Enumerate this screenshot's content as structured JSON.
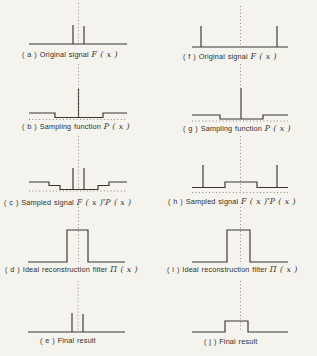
{
  "figure": {
    "background": "#f5f3ee",
    "line_color": "#39362f",
    "dotted_color": "#8f8b82",
    "text_color": "#33302a",
    "panels": [
      {
        "id": "a",
        "caption": {
          "prefix": "( a ) Original signal",
          "math1": "F ( x )"
        },
        "label_pos": {
          "x": 22,
          "y": 49.5
        },
        "shapes": [
          {
            "kind": "solid",
            "pts": [
              [
                29,
                44
              ],
              [
                127,
                44
              ]
            ]
          },
          {
            "kind": "solid",
            "pts": [
              [
                73,
                44
              ],
              [
                73,
                25
              ]
            ]
          },
          {
            "kind": "solid",
            "pts": [
              [
                84,
                44
              ],
              [
                84,
                26
              ]
            ]
          },
          {
            "kind": "dotted",
            "pts": [
              [
                78.5,
                3
              ],
              [
                78.5,
                44
              ]
            ]
          }
        ]
      },
      {
        "id": "b",
        "caption": {
          "prefix": "( b ) Sampling function",
          "math1": "P ( x )"
        },
        "label_pos": {
          "x": 22,
          "y": 121.5
        },
        "shapes": [
          {
            "kind": "solid",
            "pts": [
              [
                29,
                113
              ],
              [
                55,
                113
              ],
              [
                55,
                117.5
              ],
              [
                103,
                117.5
              ],
              [
                103,
                113
              ],
              [
                127,
                113
              ]
            ]
          },
          {
            "kind": "solid",
            "pts": [
              [
                78.5,
                117.5
              ],
              [
                78.5,
                89
              ]
            ]
          },
          {
            "kind": "dotted",
            "pts": [
              [
                29,
                119.5
              ],
              [
                127,
                119.5
              ]
            ]
          },
          {
            "kind": "dotted",
            "pts": [
              [
                78.5,
                64
              ],
              [
                78.5,
                117
              ]
            ]
          }
        ]
      },
      {
        "id": "c",
        "caption": {
          "prefix": "( c ) Sampled signal",
          "math1": "F ( x )",
          "star": "*",
          "math2": "P ( x )"
        },
        "label_pos": {
          "x": 4,
          "y": 195.5
        },
        "shapes": [
          {
            "kind": "solid",
            "pts": [
              [
                29,
                182
              ],
              [
                49,
                182
              ],
              [
                49,
                185.5
              ],
              [
                60,
                185.5
              ],
              [
                60,
                189.5
              ],
              [
                98,
                189.5
              ],
              [
                98,
                185.5
              ],
              [
                109,
                185.5
              ],
              [
                109,
                182
              ],
              [
                127,
                182
              ]
            ]
          },
          {
            "kind": "solid",
            "pts": [
              [
                73,
                189.5
              ],
              [
                73,
                168
              ]
            ]
          },
          {
            "kind": "solid",
            "pts": [
              [
                84,
                189.5
              ],
              [
                84,
                168
              ]
            ]
          },
          {
            "kind": "dotted",
            "pts": [
              [
                29,
                191
              ],
              [
                127,
                191
              ]
            ]
          },
          {
            "kind": "dotted",
            "pts": [
              [
                78.5,
                136
              ],
              [
                78.5,
                190
              ]
            ]
          }
        ]
      },
      {
        "id": "d",
        "caption": {
          "prefix": "( d ) Ideal reconstruction filter",
          "math1": "Π ( x )"
        },
        "label_pos": {
          "x": 5,
          "y": 264.5
        },
        "shapes": [
          {
            "kind": "solid",
            "pts": [
              [
                28,
                262
              ],
              [
                67,
                262
              ],
              [
                67,
                230
              ],
              [
                88,
                230
              ],
              [
                88,
                262
              ],
              [
                125,
                262
              ]
            ]
          },
          {
            "kind": "dotted",
            "pts": [
              [
                78.5,
                207
              ],
              [
                78.5,
                262
              ]
            ]
          }
        ]
      },
      {
        "id": "e",
        "caption": {
          "prefix": "( e ) Final result"
        },
        "label_pos": {
          "x": 40,
          "y": 336
        },
        "shapes": [
          {
            "kind": "solid",
            "pts": [
              [
                28,
                332
              ],
              [
                125,
                332
              ]
            ]
          },
          {
            "kind": "solid",
            "pts": [
              [
                72,
                332
              ],
              [
                72,
                313
              ]
            ]
          },
          {
            "kind": "solid",
            "pts": [
              [
                83,
                332
              ],
              [
                83,
                314
              ]
            ]
          },
          {
            "kind": "dotted",
            "pts": [
              [
                78,
                281
              ],
              [
                78,
                332
              ]
            ]
          }
        ]
      },
      {
        "id": "f",
        "caption": {
          "prefix": "( f ) Original signal",
          "math1": "F ( x )"
        },
        "label_pos": {
          "x": 183,
          "y": 52
        },
        "shapes": [
          {
            "kind": "solid",
            "pts": [
              [
                192,
                47
              ],
              [
                288,
                47
              ]
            ]
          },
          {
            "kind": "solid",
            "pts": [
              [
                201,
                47
              ],
              [
                201,
                26
              ]
            ]
          },
          {
            "kind": "solid",
            "pts": [
              [
                277,
                47
              ],
              [
                277,
                26
              ]
            ]
          },
          {
            "kind": "dotted",
            "pts": [
              [
                240.5,
                6
              ],
              [
                240.5,
                47
              ]
            ]
          }
        ]
      },
      {
        "id": "g",
        "caption": {
          "prefix": "( g ) Sampling function",
          "math1": "P ( x )"
        },
        "label_pos": {
          "x": 183,
          "y": 123.5
        },
        "shapes": [
          {
            "kind": "solid",
            "pts": [
              [
                192,
                115
              ],
              [
                220,
                115
              ],
              [
                220,
                119
              ],
              [
                263,
                119
              ],
              [
                263,
                115
              ],
              [
                288,
                115
              ]
            ]
          },
          {
            "kind": "solid",
            "pts": [
              [
                241,
                119
              ],
              [
                241,
                88
              ]
            ]
          },
          {
            "kind": "dotted",
            "pts": [
              [
                192,
                121
              ],
              [
                288,
                121
              ]
            ]
          },
          {
            "kind": "dotted",
            "pts": [
              [
                240.5,
                64
              ],
              [
                240.5,
                119
              ]
            ]
          }
        ]
      },
      {
        "id": "h",
        "caption": {
          "prefix": "( h ) Sampled signal",
          "math1": "F ( x )",
          "star": "*",
          "math2": "P ( x )"
        },
        "label_pos": {
          "x": 168,
          "y": 195
        },
        "shapes": [
          {
            "kind": "solid",
            "pts": [
              [
                192,
                187.5
              ],
              [
                225,
                187.5
              ],
              [
                225,
                182
              ],
              [
                257,
                182
              ],
              [
                257,
                187.5
              ],
              [
                288,
                187.5
              ]
            ]
          },
          {
            "kind": "solid",
            "pts": [
              [
                203,
                187.5
              ],
              [
                203,
                165
              ]
            ]
          },
          {
            "kind": "solid",
            "pts": [
              [
                277,
                187.5
              ],
              [
                277,
                165
              ]
            ]
          },
          {
            "kind": "dotted",
            "pts": [
              [
                192,
                192.5
              ],
              [
                288,
                192.5
              ]
            ]
          },
          {
            "kind": "dotted",
            "pts": [
              [
                240.5,
                136
              ],
              [
                240.5,
                191
              ]
            ]
          }
        ]
      },
      {
        "id": "i",
        "caption": {
          "prefix": "( i ) Ideal reconstruction filter",
          "math1": "Π ( x )"
        },
        "label_pos": {
          "x": 167,
          "y": 264.5
        },
        "shapes": [
          {
            "kind": "solid",
            "pts": [
              [
                192,
                262
              ],
              [
                227,
                262
              ],
              [
                227,
                230
              ],
              [
                250,
                230
              ],
              [
                250,
                262
              ],
              [
                288,
                262
              ]
            ]
          },
          {
            "kind": "dotted",
            "pts": [
              [
                240.5,
                207
              ],
              [
                240.5,
                262
              ]
            ]
          }
        ]
      },
      {
        "id": "j",
        "caption": {
          "prefix": "( j ) Final result"
        },
        "label_pos": {
          "x": 204,
          "y": 336.5
        },
        "shapes": [
          {
            "kind": "solid",
            "pts": [
              [
                192,
                332
              ],
              [
                225,
                332
              ],
              [
                225,
                321
              ],
              [
                248,
                321
              ],
              [
                248,
                332
              ],
              [
                288,
                332
              ]
            ]
          },
          {
            "kind": "dotted",
            "pts": [
              [
                240.5,
                281
              ],
              [
                240.5,
                332
              ]
            ]
          }
        ]
      }
    ]
  }
}
